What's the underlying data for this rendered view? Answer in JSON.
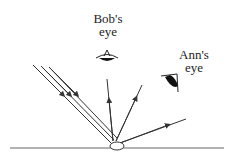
{
  "labels": {
    "bob_line1": "Bob's",
    "bob_line2": "eye",
    "ann_line1": "Ann's",
    "ann_line2": "eye"
  },
  "colors": {
    "line": "#333333",
    "eye_fill": "#111111",
    "background": "#ffffff"
  },
  "diagram": {
    "surface": {
      "x1": 10,
      "x2": 224,
      "y": 148
    },
    "object": {
      "cx": 117,
      "cy": 146,
      "rx": 7,
      "ry": 4
    },
    "incident_rays": [
      {
        "x1": 33,
        "y1": 65,
        "x2": 111,
        "y2": 143
      },
      {
        "x1": 41,
        "y1": 66,
        "x2": 114,
        "y2": 140
      },
      {
        "x1": 49,
        "y1": 67,
        "x2": 117,
        "y2": 138
      }
    ],
    "reflected_rays": [
      {
        "x1": 113,
        "y1": 141,
        "x2": 107,
        "y2": 79
      },
      {
        "x1": 116,
        "y1": 141,
        "x2": 142,
        "y2": 85
      },
      {
        "x1": 120,
        "y1": 143,
        "x2": 186,
        "y2": 119
      }
    ]
  }
}
